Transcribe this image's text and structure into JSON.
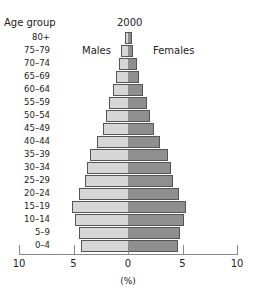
{
  "chart_data": {
    "type": "bar",
    "subtype": "population-pyramid",
    "title": "2000",
    "ylabel": "Age group",
    "xlabel": "(%)",
    "xlim": [
      -10,
      10
    ],
    "xticks": [
      "10",
      "5",
      "0",
      "5",
      "10"
    ],
    "categories": [
      "80+",
      "75–79",
      "70–74",
      "65–69",
      "60–64",
      "55–59",
      "50–54",
      "45–49",
      "40–44",
      "35–39",
      "30–34",
      "25–29",
      "20–24",
      "15–19",
      "10–14",
      "5–9",
      "0–4"
    ],
    "series": [
      {
        "name": "Males",
        "color": "#d6d6d6",
        "values": [
          0.3,
          0.6,
          0.8,
          1.1,
          1.4,
          1.7,
          2.0,
          2.3,
          2.8,
          3.5,
          3.8,
          3.9,
          4.5,
          5.1,
          4.9,
          4.5,
          4.3
        ]
      },
      {
        "name": "Females",
        "color": "#8f8f8f",
        "values": [
          0.4,
          0.5,
          0.8,
          1.0,
          1.4,
          1.7,
          2.0,
          2.4,
          2.9,
          3.7,
          3.9,
          4.1,
          4.7,
          5.3,
          5.1,
          4.8,
          4.6
        ]
      }
    ],
    "legend": [
      "Males",
      "Females"
    ],
    "grid": false
  },
  "labels": {
    "age_header": "Age group",
    "title": "2000",
    "males": "Males",
    "females": "Females",
    "xlabel": "(%)"
  }
}
